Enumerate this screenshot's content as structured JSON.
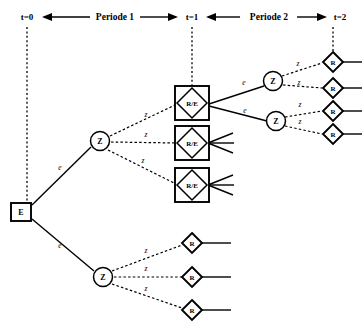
{
  "figure": {
    "background_color": "#ffffff",
    "line_color": "#000000"
  },
  "timeline": {
    "ticks": [
      {
        "id": "t0",
        "label": "t=0",
        "x": 27
      },
      {
        "id": "t1",
        "label": "t=1",
        "x": 192
      },
      {
        "id": "t2",
        "label": "t=2",
        "x": 340
      }
    ],
    "periods": [
      {
        "id": "period1",
        "label": "Periode 1",
        "from": "t=0",
        "to": "t=1"
      },
      {
        "id": "period2",
        "label": "Periode 2",
        "from": "t=1",
        "to": "t=2"
      }
    ]
  },
  "node_types": {
    "E": {
      "shape": "square",
      "label": "E",
      "meaning": "decision-node-invest"
    },
    "Z": {
      "shape": "circle",
      "label": "Z",
      "meaning": "chance-node"
    },
    "R/E": {
      "shape": "square-with-diamond",
      "label": "R/E",
      "meaning": "payoff-and-decision-node"
    },
    "R": {
      "shape": "diamond",
      "label": "R",
      "meaning": "payoff-node"
    }
  },
  "edge_types": {
    "e": {
      "label": "e",
      "style": "solid",
      "meaning": "decision-branch"
    },
    "z": {
      "label": "z",
      "style": "dashed",
      "meaning": "chance-branch"
    }
  },
  "nodes": [
    {
      "id": "n-e-root",
      "type": "E",
      "label": "E",
      "x": 21,
      "y": 212
    },
    {
      "id": "n-z-upper",
      "type": "Z",
      "label": "Z",
      "x": 100,
      "y": 141
    },
    {
      "id": "n-z-lower",
      "type": "Z",
      "label": "Z",
      "x": 103,
      "y": 277
    },
    {
      "id": "n-re-1",
      "type": "R/E",
      "label": "R/E",
      "x": 192,
      "y": 103
    },
    {
      "id": "n-re-2",
      "type": "R/E",
      "label": "R/E",
      "x": 192,
      "y": 143
    },
    {
      "id": "n-re-3",
      "type": "R/E",
      "label": "R/E",
      "x": 192,
      "y": 185
    },
    {
      "id": "n-z-r1",
      "type": "Z",
      "label": "Z",
      "x": 273,
      "y": 81
    },
    {
      "id": "n-z-r2",
      "type": "Z",
      "label": "Z",
      "x": 276,
      "y": 121
    },
    {
      "id": "n-r-1",
      "type": "R",
      "label": "R",
      "x": 333,
      "y": 62
    },
    {
      "id": "n-r-2",
      "type": "R",
      "label": "R",
      "x": 333,
      "y": 88
    },
    {
      "id": "n-r-3",
      "type": "R",
      "label": "R",
      "x": 333,
      "y": 111
    },
    {
      "id": "n-r-4",
      "type": "R",
      "label": "R",
      "x": 333,
      "y": 134
    },
    {
      "id": "n-r-5",
      "type": "R",
      "label": "R",
      "x": 192,
      "y": 243
    },
    {
      "id": "n-r-6",
      "type": "R",
      "label": "R",
      "x": 192,
      "y": 277
    },
    {
      "id": "n-r-7",
      "type": "R",
      "label": "R",
      "x": 192,
      "y": 310
    }
  ],
  "edges": [
    {
      "id": "edge-e-zupper",
      "from": "n-e-root",
      "to": "n-z-upper",
      "label": "e",
      "style": "solid",
      "label_x": 60,
      "label_y": 170
    },
    {
      "id": "edge-e-zlower",
      "from": "n-e-root",
      "to": "n-z-lower",
      "label": "e",
      "style": "solid",
      "label_x": 60,
      "label_y": 248
    },
    {
      "id": "edge-z-re1",
      "from": "n-z-upper",
      "to": "n-re-1",
      "label": "z",
      "style": "dashed",
      "label_x": 146,
      "label_y": 117
    },
    {
      "id": "edge-z-re2",
      "from": "n-z-upper",
      "to": "n-re-2",
      "label": "z",
      "style": "dashed",
      "label_x": 146,
      "label_y": 137
    },
    {
      "id": "edge-z-re3",
      "from": "n-z-upper",
      "to": "n-re-3",
      "label": "z",
      "style": "dashed",
      "label_x": 143,
      "label_y": 163
    },
    {
      "id": "edge-e-zr1",
      "from": "n-re-1",
      "to": "n-z-r1",
      "label": "e",
      "style": "solid",
      "label_x": 244,
      "label_y": 85
    },
    {
      "id": "edge-e-zr2",
      "from": "n-re-1",
      "to": "n-z-r2",
      "label": "e",
      "style": "solid",
      "label_x": 245,
      "label_y": 113
    },
    {
      "id": "edge-z-r1",
      "from": "n-z-r1",
      "to": "n-r-1",
      "label": "z",
      "style": "dashed",
      "label_x": 298,
      "label_y": 66
    },
    {
      "id": "edge-z-r2",
      "from": "n-z-r1",
      "to": "n-r-2",
      "label": "z",
      "style": "dashed",
      "label_x": 299,
      "label_y": 85
    },
    {
      "id": "edge-z-r3",
      "from": "n-z-r2",
      "to": "n-r-3",
      "label": "z",
      "style": "dashed",
      "label_x": 300,
      "label_y": 107
    },
    {
      "id": "edge-z-r4",
      "from": "n-z-r2",
      "to": "n-r-4",
      "label": "z",
      "style": "dashed",
      "label_x": 300,
      "label_y": 124
    },
    {
      "id": "edge-z-r5",
      "from": "n-z-lower",
      "to": "n-r-5",
      "label": "z",
      "style": "dashed",
      "label_x": 146,
      "label_y": 253
    },
    {
      "id": "edge-z-r6",
      "from": "n-z-lower",
      "to": "n-r-6",
      "label": "z",
      "style": "dashed",
      "label_x": 146,
      "label_y": 271
    },
    {
      "id": "edge-z-r7",
      "from": "n-z-lower",
      "to": "n-r-7",
      "label": "z",
      "style": "dashed",
      "label_x": 146,
      "label_y": 291
    }
  ],
  "stub_fans": [
    {
      "id": "stub-fan-re2",
      "at": "n-re-2",
      "count": 3
    },
    {
      "id": "stub-fan-re3",
      "at": "n-re-3",
      "count": 3
    }
  ],
  "terminal_lines": [
    {
      "id": "terminal-r1",
      "at": "n-r-1",
      "to_x": 362
    },
    {
      "id": "terminal-r2",
      "at": "n-r-2",
      "to_x": 362
    },
    {
      "id": "terminal-r3",
      "at": "n-r-3",
      "to_x": 362
    },
    {
      "id": "terminal-r4",
      "at": "n-r-4",
      "to_x": 362
    },
    {
      "id": "terminal-r5",
      "at": "n-r-5",
      "to_x": 231
    },
    {
      "id": "terminal-r6",
      "at": "n-r-6",
      "to_x": 231
    },
    {
      "id": "terminal-r7",
      "at": "n-r-7",
      "to_x": 231
    }
  ]
}
